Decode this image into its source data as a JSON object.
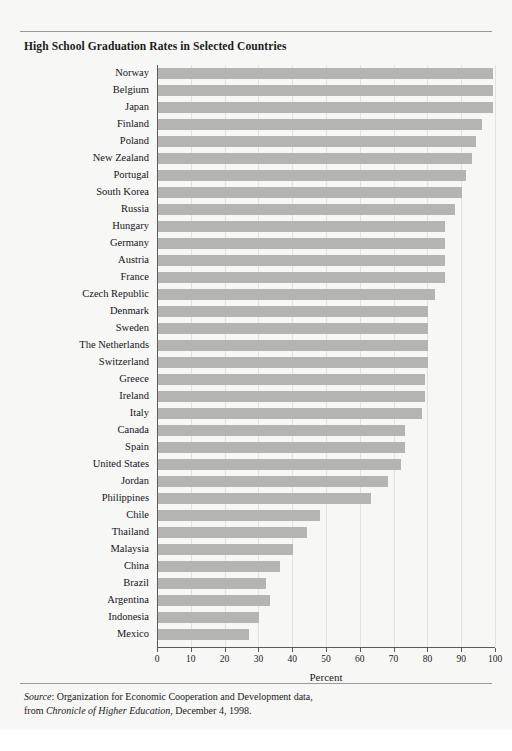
{
  "figure": {
    "title": "High School Graduation Rates in Selected Countries",
    "source_prefix": "Source",
    "source_line1_rest": ": Organization for Economic Cooperation and Development data,",
    "source_line2_pre": "from ",
    "source_publication": "Chronicle of Higher Education",
    "source_line2_post": ", December 4, 1998.",
    "bar_color": "#b4b4b2",
    "background_color": "#f7f7f5",
    "axis_color": "#5a5a58",
    "gridline_color": "#e2e2de"
  },
  "chart_data": {
    "type": "bar",
    "orientation": "horizontal",
    "title": "High School Graduation Rates in Selected Countries",
    "xlabel": "Percent",
    "ylabel": "",
    "xlim": [
      0,
      100
    ],
    "xticks": [
      0,
      10,
      20,
      30,
      40,
      50,
      60,
      70,
      80,
      90,
      100
    ],
    "grid": true,
    "legend": "none",
    "categories": [
      "Norway",
      "Belgium",
      "Japan",
      "Finland",
      "Poland",
      "New Zealand",
      "Portugal",
      "South Korea",
      "Russia",
      "Hungary",
      "Germany",
      "Austria",
      "France",
      "Czech Republic",
      "Denmark",
      "Sweden",
      "The Netherlands",
      "Switzerland",
      "Greece",
      "Ireland",
      "Italy",
      "Canada",
      "Spain",
      "United States",
      "Jordan",
      "Philippines",
      "Chile",
      "Thailand",
      "Malaysia",
      "China",
      "Brazil",
      "Argentina",
      "Indonesia",
      "Mexico"
    ],
    "values": [
      99,
      99,
      99,
      96,
      94,
      93,
      91,
      90,
      88,
      85,
      85,
      85,
      85,
      82,
      80,
      80,
      80,
      80,
      79,
      79,
      78,
      73,
      73,
      72,
      68,
      63,
      48,
      44,
      40,
      36,
      32,
      33,
      30,
      27
    ]
  }
}
